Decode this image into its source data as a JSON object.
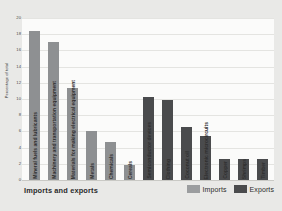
{
  "chart_data": {
    "type": "bar",
    "title": "Imports and exports",
    "xlabel": "",
    "ylabel": "Percentage of total",
    "ylim": [
      0,
      20
    ],
    "yticks": [
      0,
      2,
      4,
      6,
      8,
      10,
      12,
      14,
      16,
      18,
      20
    ],
    "grid": true,
    "legend_position": "bottom-right",
    "categories": [
      "Mineral fuels and lubricants",
      "Machinery and transportation equipment",
      "Materials for making electrical equipment",
      "Metals",
      "Chemicals",
      "Cereals",
      "Semiconductor devices",
      "Clothing",
      "Coconut oil",
      "Electronic microcircuits",
      "Copper",
      "Shrimps",
      "Timber"
    ],
    "values": [
      18.4,
      17.0,
      11.4,
      6.1,
      4.7,
      1.8,
      10.2,
      9.9,
      6.6,
      5.4,
      2.6,
      2.6,
      2.6
    ],
    "groups": [
      "Imports",
      "Imports",
      "Imports",
      "Imports",
      "Imports",
      "Imports",
      "Exports",
      "Exports",
      "Exports",
      "Exports",
      "Exports",
      "Exports",
      "Exports"
    ],
    "series": [
      {
        "name": "Imports",
        "color": "#8e9092",
        "points": [
          {
            "category": "Mineral fuels and lubricants",
            "value": 18.4
          },
          {
            "category": "Machinery and transportation equipment",
            "value": 17.0
          },
          {
            "category": "Materials for making electrical equipment",
            "value": 11.4
          },
          {
            "category": "Metals",
            "value": 6.1
          },
          {
            "category": "Chemicals",
            "value": 4.7
          },
          {
            "category": "Cereals",
            "value": 1.8
          }
        ]
      },
      {
        "name": "Exports",
        "color": "#4a4b4d",
        "points": [
          {
            "category": "Semiconductor devices",
            "value": 10.2
          },
          {
            "category": "Clothing",
            "value": 9.9
          },
          {
            "category": "Coconut oil",
            "value": 6.6
          },
          {
            "category": "Electronic microcircuits",
            "value": 5.4
          },
          {
            "category": "Copper",
            "value": 2.6
          },
          {
            "category": "Shrimps",
            "value": 2.6
          },
          {
            "category": "Timber",
            "value": 2.6
          }
        ]
      }
    ]
  },
  "axis": {
    "y_title": "Percentage of total",
    "ticks": [
      "20",
      "18",
      "16",
      "14",
      "12",
      "10",
      "8",
      "6",
      "4",
      "2",
      "0"
    ]
  },
  "footer": {
    "title": "Imports and exports"
  },
  "legend": {
    "items": [
      {
        "label": "Imports",
        "color": "#9b9d9f"
      },
      {
        "label": "Exports",
        "color": "#4a4b4d"
      }
    ]
  },
  "colors": {
    "panel_background": "#e9e9e7",
    "plot_background": "#fbfbfa",
    "gridline": "#e4e4e1",
    "imports": "#8e9092",
    "exports": "#4a4b4d",
    "text": "#2b2b2b"
  }
}
